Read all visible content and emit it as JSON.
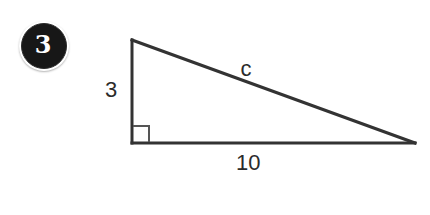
{
  "figure": {
    "type": "right-triangle-diagram",
    "problem_number": "3",
    "background_color": "#ffffff",
    "stroke_color": "#333333",
    "text_color": "#2b2b2b",
    "badge": {
      "number": "3",
      "fill_color": "#171717",
      "text_color": "#ffffff"
    },
    "geometry": {
      "apex": {
        "x": 132,
        "y": 40
      },
      "right_angle_vertex": {
        "x": 132,
        "y": 143
      },
      "far_vertex": {
        "x": 415,
        "y": 143
      },
      "right_angle_marker_size": 16
    },
    "labels": {
      "vertical_leg": "3",
      "hypotenuse": "c",
      "base": "10"
    },
    "label_positions": {
      "vertical_leg": {
        "x": 111,
        "y": 97
      },
      "hypotenuse": {
        "x": 246,
        "y": 76
      },
      "base": {
        "x": 236,
        "y": 170
      }
    }
  }
}
